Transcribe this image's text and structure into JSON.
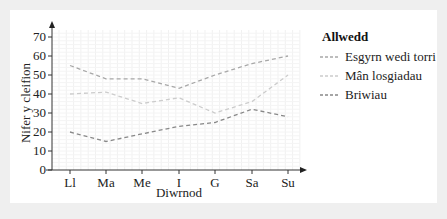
{
  "chart_data": {
    "type": "line",
    "title": "",
    "xlabel": "Diwrnod",
    "ylabel": "Nifer y cleifion",
    "categories": [
      "Ll",
      "Ma",
      "Me",
      "I",
      "G",
      "Sa",
      "Su"
    ],
    "yticks": [
      0,
      10,
      20,
      30,
      40,
      50,
      60,
      70
    ],
    "ylim": [
      0,
      75
    ],
    "grid": true,
    "legend_position": "right",
    "legend_title": "Allwedd",
    "series": [
      {
        "name": "Esgyrn wedi torri",
        "color": "#a8a8a8",
        "values": [
          55,
          48,
          48,
          43,
          50,
          56,
          60
        ]
      },
      {
        "name": "Mân losgiadau",
        "color": "#cccccc",
        "values": [
          40,
          41,
          35,
          38,
          30,
          36,
          50
        ]
      },
      {
        "name": "Briwiau",
        "color": "#888888",
        "values": [
          20,
          15,
          19,
          23,
          25,
          32,
          28
        ]
      }
    ]
  },
  "legend": {
    "title": "Allwedd",
    "items": [
      "Esgyrn wedi torri",
      "Mân losgiadau",
      "Briwiau"
    ]
  },
  "axes": {
    "x_title": "Diwrnod",
    "y_title": "Nifer y cleifion"
  }
}
